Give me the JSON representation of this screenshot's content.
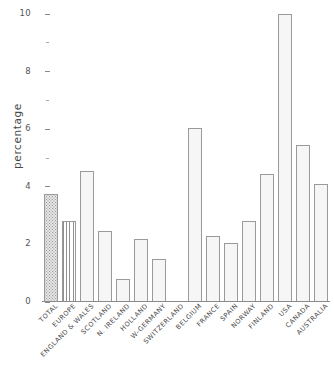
{
  "chart_data": {
    "type": "bar",
    "title": "",
    "subtitle": "",
    "xlabel": "",
    "ylabel": "percentage",
    "ylim": [
      0,
      10
    ],
    "grid": false,
    "legend": null,
    "y_ticks": [
      {
        "value": 10,
        "label": "10",
        "major": true
      },
      {
        "value": 9,
        "label": "",
        "major": false
      },
      {
        "value": 8,
        "label": "8",
        "major": true
      },
      {
        "value": 7,
        "label": "",
        "major": false
      },
      {
        "value": 6,
        "label": "6",
        "major": true
      },
      {
        "value": 5,
        "label": "",
        "major": false
      },
      {
        "value": 4,
        "label": "4",
        "major": true
      },
      {
        "value": 3,
        "label": "",
        "major": false
      },
      {
        "value": 2,
        "label": "2",
        "major": true
      },
      {
        "value": 1,
        "label": "",
        "major": false
      },
      {
        "value": 0,
        "label": "0",
        "major": true
      }
    ],
    "categories": [
      "TOTAL",
      "EUROPE",
      "ENGLAND & WALES",
      "SCOTLAND",
      "N. IRELAND",
      "HOLLAND",
      "W-GERMANY",
      "SWITZERLAND",
      "BELGIUM",
      "FRANCE",
      "SPAIN",
      "NORWAY",
      "FINLAND",
      "USA",
      "CANADA",
      "AUSTRALIA"
    ],
    "values": [
      3.75,
      2.8,
      4.55,
      2.45,
      0.8,
      2.2,
      1.5,
      null,
      6.05,
      2.3,
      2.05,
      2.8,
      4.45,
      10.0,
      5.45,
      4.1
    ],
    "bar_fills": [
      "dots",
      "vlines",
      "plain",
      "plain",
      "plain",
      "plain",
      "plain",
      "none",
      "plain",
      "plain",
      "plain",
      "plain",
      "plain",
      "plain",
      "plain",
      "plain"
    ],
    "colors": {
      "bar_face": "#f4f4f4",
      "bar_edge": "#9a9a9a",
      "hatch": "#9d9d9d",
      "axis": "#8a8a8a",
      "text": "#4a4a4a"
    }
  }
}
